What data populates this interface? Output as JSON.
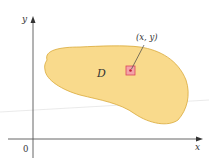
{
  "diagram": {
    "region_label": "D",
    "point_label": "(x, y)",
    "x_axis_label": "x",
    "y_axis_label": "y",
    "origin_label": "0",
    "colors": {
      "region_fill": "#F9DA8C",
      "region_stroke": "#D9A93A",
      "axis": "#555555",
      "square_fill": "#F4A3A8",
      "square_stroke": "#D9455A",
      "point": "#C0203A",
      "text": "#333333"
    }
  }
}
